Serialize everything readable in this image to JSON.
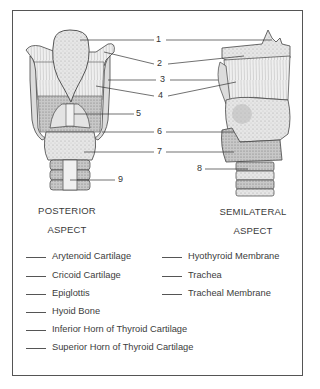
{
  "diagram": {
    "views": [
      {
        "id": "posterior",
        "caption_line1": "POSTERIOR",
        "caption_line2": "ASPECT"
      },
      {
        "id": "semilateral",
        "caption_line1": "SEMILATERAL",
        "caption_line2": "ASPECT"
      }
    ],
    "callout_numbers": [
      "1",
      "2",
      "3",
      "4",
      "5",
      "6",
      "7",
      "8",
      "9"
    ],
    "legend": {
      "left_column": [
        "Arytenoid Cartilage",
        "Cricoid Cartilage",
        "Epiglottis",
        "Hyoid Bone",
        "Inferior Horn of Thyroid Cartilage",
        "Superior Horn of Thyroid Cartilage"
      ],
      "right_column": [
        "Hyothyroid Membrane",
        "Trachea",
        "Tracheal Membrane"
      ]
    },
    "colors": {
      "line": "#444444",
      "fill_light": "#e8e8e8",
      "fill_mid": "#cfcfcf",
      "fill_dark": "#9a9a9a",
      "frame": "#555555"
    }
  }
}
